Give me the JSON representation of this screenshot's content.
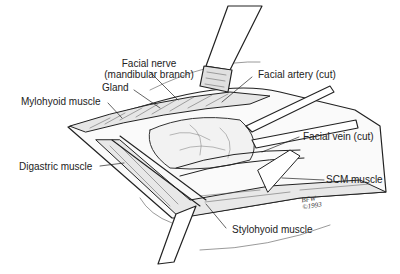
{
  "figure": {
    "type": "surgical anatomical illustration",
    "labels": {
      "facial_nerve_line1": "Facial nerve",
      "facial_nerve_line2": "(mandibular branch)",
      "gland": "Gland",
      "mylohyoid": "Mylohyoid muscle",
      "facial_artery": "Facial artery (cut)",
      "facial_vein": "Facial vein (cut)",
      "digastric": "Digastric muscle",
      "scm": "SCM muscle",
      "stylohyoid": "Stylohyoid muscle"
    },
    "signature": {
      "initials": "BFW",
      "year": "©1993"
    }
  }
}
